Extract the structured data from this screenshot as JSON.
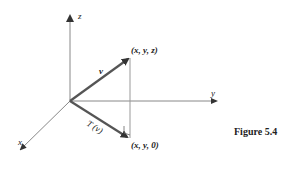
{
  "figure": {
    "caption": "Figure 5.4",
    "axes": {
      "x_label": "x",
      "y_label": "y",
      "z_label": "z"
    },
    "vectors": {
      "v_label": "v",
      "tv_label": "T (v)"
    },
    "points": {
      "tip_label": "(x, y, z)",
      "projection_label": "(x, y, 0)"
    },
    "colors": {
      "axis": "#888888",
      "vector": "#555555",
      "text": "#222222"
    }
  }
}
